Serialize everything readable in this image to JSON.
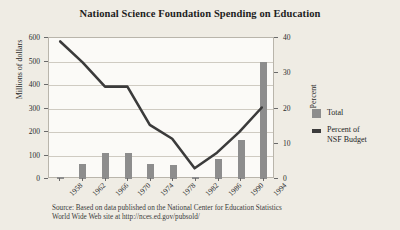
{
  "chart_data": {
    "type": "bar",
    "title": "National Science Foundation Spending on Education",
    "xlabel": "",
    "ylabel": "Millions of dollars",
    "y2label": "Percent",
    "categories": [
      "1958",
      "1962",
      "1966",
      "1970",
      "1974",
      "1978",
      "1982",
      "1986",
      "1990",
      "1994"
    ],
    "ylim": [
      0,
      600
    ],
    "yticks": [
      "0",
      "100",
      "200",
      "300",
      "400",
      "500",
      "600"
    ],
    "y2lim": [
      0,
      40
    ],
    "y2ticks": [
      "0",
      "10",
      "20",
      "30",
      "40"
    ],
    "grid": true,
    "legend_position": "right",
    "series": [
      {
        "name": "Total",
        "type": "bar",
        "axis": "left",
        "color": "#8d8d8d",
        "values": [
          10,
          65,
          110,
          110,
          65,
          60,
          10,
          85,
          165,
          500
        ]
      },
      {
        "name": "Percent of NSF Budget",
        "type": "line",
        "axis": "right",
        "color": "#3b3b3b",
        "values": [
          39,
          33,
          26,
          26,
          15,
          11,
          2.5,
          7,
          13,
          20
        ]
      }
    ],
    "source_lines": [
      "Source: Based on data published on the National Center for Education Statistics",
      "World Wide Web site at http://nces.ed.gov/pubsold/"
    ]
  },
  "legend": {
    "total_label": "Total",
    "percent_label_line1": "Percent of",
    "percent_label_line2": "NSF Budget"
  },
  "colors": {
    "bar": "#8d8d8d",
    "line": "#3b3b3b",
    "background": "#efece4",
    "plot_background": "#fbfaf7"
  }
}
